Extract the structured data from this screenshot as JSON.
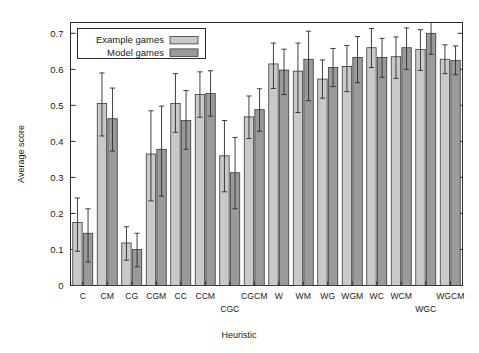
{
  "chart_data": {
    "type": "bar",
    "title": "",
    "xlabel": "Heuristic",
    "ylabel": "Average score",
    "ylim": [
      0,
      0.73
    ],
    "yticks": [
      0,
      0.1,
      0.2,
      0.3,
      0.4,
      0.5,
      0.6,
      0.7
    ],
    "ytick_labels": [
      "0",
      "0.1",
      "0.2",
      "0.3",
      "0.4",
      "0.5",
      "0.6",
      "0.7"
    ],
    "grid": false,
    "legend_position": "upper left",
    "errorbars": true,
    "categories": [
      "C",
      "CM",
      "CG",
      "CGM",
      "CC",
      "CCM",
      "CGC",
      "CGCM",
      "W",
      "WM",
      "WG",
      "WGM",
      "WC",
      "WCM",
      "WGC",
      "WGCM"
    ],
    "series": [
      {
        "name": "Example games",
        "color": "#c9c9c9",
        "values": [
          0.175,
          0.505,
          0.118,
          0.365,
          0.505,
          0.53,
          0.36,
          0.468,
          0.615,
          0.595,
          0.573,
          0.608,
          0.66,
          0.635,
          0.655,
          0.628
        ],
        "err_low": [
          0.08,
          0.09,
          0.048,
          0.13,
          0.08,
          0.063,
          0.1,
          0.06,
          0.068,
          0.115,
          0.053,
          0.07,
          0.055,
          0.06,
          0.058,
          0.04
        ],
        "err_high": [
          0.068,
          0.085,
          0.045,
          0.12,
          0.083,
          0.063,
          0.098,
          0.058,
          0.058,
          0.078,
          0.053,
          0.058,
          0.053,
          0.055,
          0.055,
          0.04
        ]
      },
      {
        "name": "Model games",
        "color": "#9a9a9a",
        "values": [
          0.145,
          0.463,
          0.1,
          0.378,
          0.458,
          0.533,
          0.313,
          0.488,
          0.598,
          0.628,
          0.605,
          0.633,
          0.633,
          0.66,
          0.7,
          0.625
        ]
      }
    ],
    "legend": [
      {
        "label": "Example games",
        "swatch": "#c9c9c9"
      },
      {
        "label": "Model games",
        "swatch": "#9a9a9a"
      }
    ]
  },
  "axis": {
    "ylabel": "Average score",
    "xlabel": "Heuristic"
  }
}
